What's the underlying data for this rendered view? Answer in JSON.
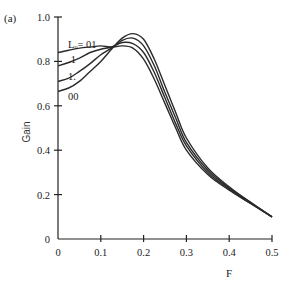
{
  "chart_data": {
    "type": "line",
    "panel_label": "(a)",
    "title": "",
    "xlabel": "F",
    "ylabel": "Gain",
    "xlim": [
      0,
      0.5
    ],
    "ylim": [
      0,
      1.0
    ],
    "x_ticks": [
      "0",
      "0.1",
      "0.2",
      "0.3",
      "0.4",
      "0.5"
    ],
    "y_ticks": [
      "0",
      "0.2",
      "0.4",
      "0.6",
      "0.8",
      "1.0"
    ],
    "grid": false,
    "legend_position": "inline labels at left of curves",
    "x": [
      0,
      0.025,
      0.05,
      0.075,
      0.1,
      0.125,
      0.15,
      0.175,
      0.2,
      0.225,
      0.25,
      0.275,
      0.3,
      0.35,
      0.4,
      0.45,
      0.5
    ],
    "series": [
      {
        "name": "Lo=.01",
        "label": "Lₒ=.01",
        "values": [
          0.84,
          0.85,
          0.86,
          0.865,
          0.87,
          0.865,
          0.87,
          0.86,
          0.81,
          0.72,
          0.61,
          0.5,
          0.4,
          0.29,
          0.22,
          0.16,
          0.1
        ]
      },
      {
        "name": ".1",
        "label": ".1",
        "values": [
          0.78,
          0.795,
          0.815,
          0.84,
          0.855,
          0.865,
          0.885,
          0.88,
          0.84,
          0.75,
          0.635,
          0.52,
          0.42,
          0.3,
          0.225,
          0.16,
          0.1
        ]
      },
      {
        "name": "1.",
        "label": "1.",
        "values": [
          0.71,
          0.725,
          0.755,
          0.79,
          0.83,
          0.86,
          0.895,
          0.905,
          0.87,
          0.78,
          0.66,
          0.545,
          0.435,
          0.31,
          0.23,
          0.165,
          0.1
        ]
      },
      {
        "name": "00",
        "label": "00",
        "values": [
          0.665,
          0.68,
          0.71,
          0.755,
          0.8,
          0.855,
          0.905,
          0.925,
          0.9,
          0.81,
          0.69,
          0.57,
          0.455,
          0.32,
          0.235,
          0.165,
          0.1
        ]
      }
    ]
  }
}
